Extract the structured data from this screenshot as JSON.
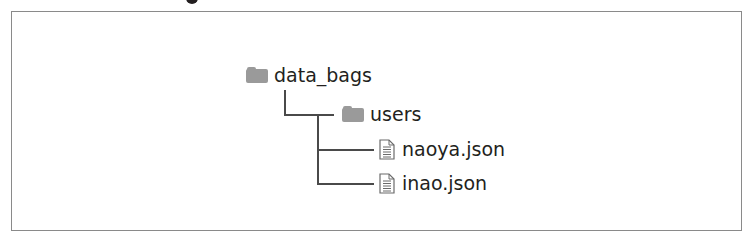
{
  "diagram": {
    "type": "directory-tree",
    "colors": {
      "frame_border": "#8a8a8a",
      "connector": "#4a4a4a",
      "folder_icon": "#9a9a9a",
      "text": "#231f20"
    },
    "root": {
      "name": "data_bags",
      "icon": "folder-icon",
      "children": [
        {
          "name": "users",
          "icon": "folder-icon",
          "children": [
            {
              "name": "naoya.json",
              "icon": "file-icon"
            },
            {
              "name": "inao.json",
              "icon": "file-icon"
            }
          ]
        }
      ]
    }
  }
}
